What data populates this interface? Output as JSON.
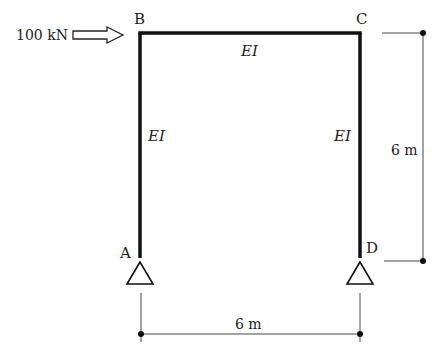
{
  "diagram": {
    "type": "portal-frame",
    "nodes": {
      "A": {
        "label": "A",
        "support": "pin"
      },
      "B": {
        "label": "B"
      },
      "C": {
        "label": "C"
      },
      "D": {
        "label": "D",
        "support": "pin"
      }
    },
    "members": [
      {
        "name": "AB",
        "stiffness_label": "EI"
      },
      {
        "name": "BC",
        "stiffness_label": "EI"
      },
      {
        "name": "CD",
        "stiffness_label": "EI"
      }
    ],
    "load": {
      "label": "100 kN",
      "direction": "right",
      "at_node": "B"
    },
    "dimensions": {
      "height": "6 m",
      "span": "6 m"
    },
    "colors": {
      "member": "#111111",
      "dimension": "#333333"
    }
  }
}
